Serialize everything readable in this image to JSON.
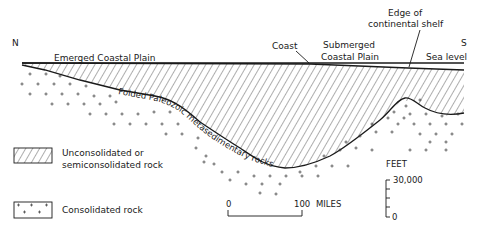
{
  "diagram": {
    "orientation": {
      "north": "N",
      "south": "S"
    },
    "labels": {
      "emerged_coastal_plain": "Emerged Coastal Plain",
      "coast": "Coast",
      "submerged_line1": "Submerged",
      "submerged_line2": "Coastal Plain",
      "shelf_edge_line1": "Edge of",
      "shelf_edge_line2": "continental shelf",
      "sea_level": "Sea level",
      "basement": "Folded Paleozoic metasedimentary rocks"
    },
    "legend": [
      {
        "pattern": "hatched",
        "line1": "Unconsolidated or",
        "line2": "semiconsolidated rock"
      },
      {
        "pattern": "crosses",
        "line1": "Consolidated rock"
      }
    ],
    "horizontal_scale": {
      "start": "0",
      "end": "100",
      "unit": "MILES"
    },
    "vertical_scale": {
      "unit": "FEET",
      "top": "30,000",
      "bottom": "0"
    },
    "colors": {
      "ink": "#1a1a1a",
      "background": "#ffffff"
    }
  }
}
